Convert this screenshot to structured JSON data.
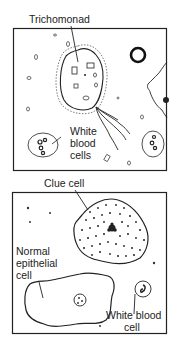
{
  "figure": {
    "panels": [
      {
        "name": "trichomoniasis-panel",
        "labels": {
          "trichomonad": "Trichomonad",
          "wbc_line1": "White",
          "wbc_line2": "blood",
          "wbc_line3": "cells"
        }
      },
      {
        "name": "bacterial-vaginosis-panel",
        "labels": {
          "clue_cell": "Clue cell",
          "normal_line1": "Normal",
          "normal_line2": "epithelial",
          "normal_line3": "cell",
          "wbc_line1": "White blood",
          "wbc_line2": "cell"
        }
      }
    ],
    "colors": {
      "ink": "#1a1a1a",
      "background": "#ffffff"
    }
  }
}
